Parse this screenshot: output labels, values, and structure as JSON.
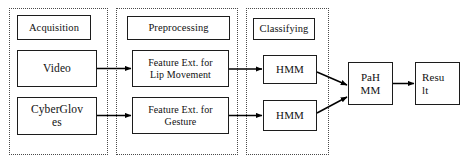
{
  "diagram": {
    "colors": {
      "background": "#ffffff",
      "box_border": "#1c1c1c",
      "group_border": "#4a4a4a",
      "arrow": "#000000",
      "text": "#111111"
    },
    "groups": [
      {
        "id": "acquisition",
        "label": "Acquisition"
      },
      {
        "id": "preprocessing",
        "label": "Preprocessing"
      },
      {
        "id": "classifying",
        "label": "Classifying"
      }
    ],
    "nodes": {
      "acquisition_label": "Acquisition",
      "video": "Video",
      "cybergloves": "CyberGloves",
      "cybergloves_line1": "CyberGlov",
      "cybergloves_line2": "es",
      "preprocessing_label": "Preprocessing",
      "feature_lip_line1": "Feature Ext. for",
      "feature_lip_line2": "Lip Movement",
      "feature_gesture_line1": "Feature Ext. for",
      "feature_gesture_line2": "Gesture",
      "classifying_label": "Classifying",
      "hmm_top": "HMM",
      "hmm_bottom": "HMM",
      "pahmm_line1": "PaH",
      "pahmm_line2": "MM",
      "result_line1": "Resu",
      "result_line2": "lt"
    },
    "edges": [
      {
        "from": "video",
        "to": "feature_lip",
        "style": "straight-arrow"
      },
      {
        "from": "cybergloves",
        "to": "feature_gesture",
        "style": "straight-arrow"
      },
      {
        "from": "feature_lip",
        "to": "hmm_top",
        "style": "straight-arrow"
      },
      {
        "from": "feature_gesture",
        "to": "hmm_bottom",
        "style": "straight-arrow"
      },
      {
        "from": "hmm_top",
        "to": "pahmm",
        "style": "diagonal-arrow"
      },
      {
        "from": "hmm_bottom",
        "to": "pahmm",
        "style": "diagonal-arrow"
      },
      {
        "from": "pahmm",
        "to": "result",
        "style": "straight-arrow"
      }
    ]
  }
}
